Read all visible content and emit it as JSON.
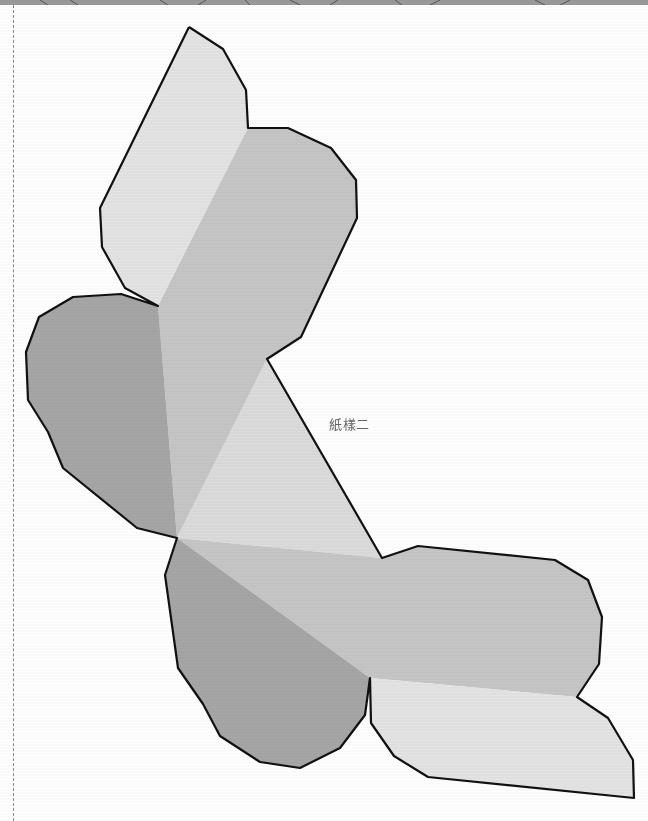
{
  "figure": {
    "label": "紙樣二",
    "colors": {
      "outline": "#111111",
      "face_light": "#e4e4e4",
      "face_mid": "#c6c6c6",
      "face_dark": "#a6a6a6",
      "face_center": "#dcdcdc",
      "top_strip": "#9a9a9a",
      "guide_line": "#8a8a8a",
      "label_text": "#666666"
    }
  }
}
